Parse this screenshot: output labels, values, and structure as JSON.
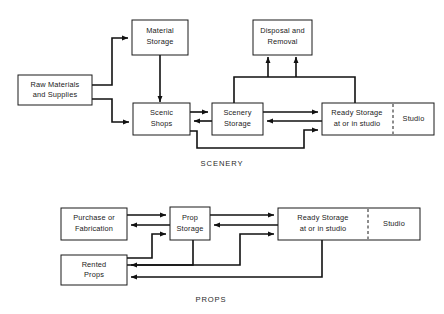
{
  "diagram": {
    "title_scenery": "SCENERY",
    "title_props": "PROPS",
    "accent_color": "#111111",
    "box_fill": "#ffffff",
    "box_stroke": "#1a1a1a",
    "scenery": {
      "boxes": {
        "raw_materials_line1": "Raw Materials",
        "raw_materials_line2": "and Supplies",
        "material_storage_line1": "Material",
        "material_storage_line2": "Storage",
        "scenic_shops_line1": "Scenic",
        "scenic_shops_line2": "Shops",
        "scenery_storage_line1": "Scenery",
        "scenery_storage_line2": "Storage",
        "disposal_line1": "Disposal and",
        "disposal_line2": "Removal",
        "ready_storage_line1": "Ready Storage",
        "ready_storage_line2": "at or in studio",
        "studio": "Studio"
      }
    },
    "props": {
      "boxes": {
        "purchase_line1": "Purchase or",
        "purchase_line2": "Fabrication",
        "prop_storage_line1": "Prop",
        "prop_storage_line2": "Storage",
        "rented_props_line1": "Rented",
        "rented_props_line2": "Props",
        "ready_storage_line1": "Ready Storage",
        "ready_storage_line2": "at or in studio",
        "studio": "Studio"
      }
    }
  }
}
